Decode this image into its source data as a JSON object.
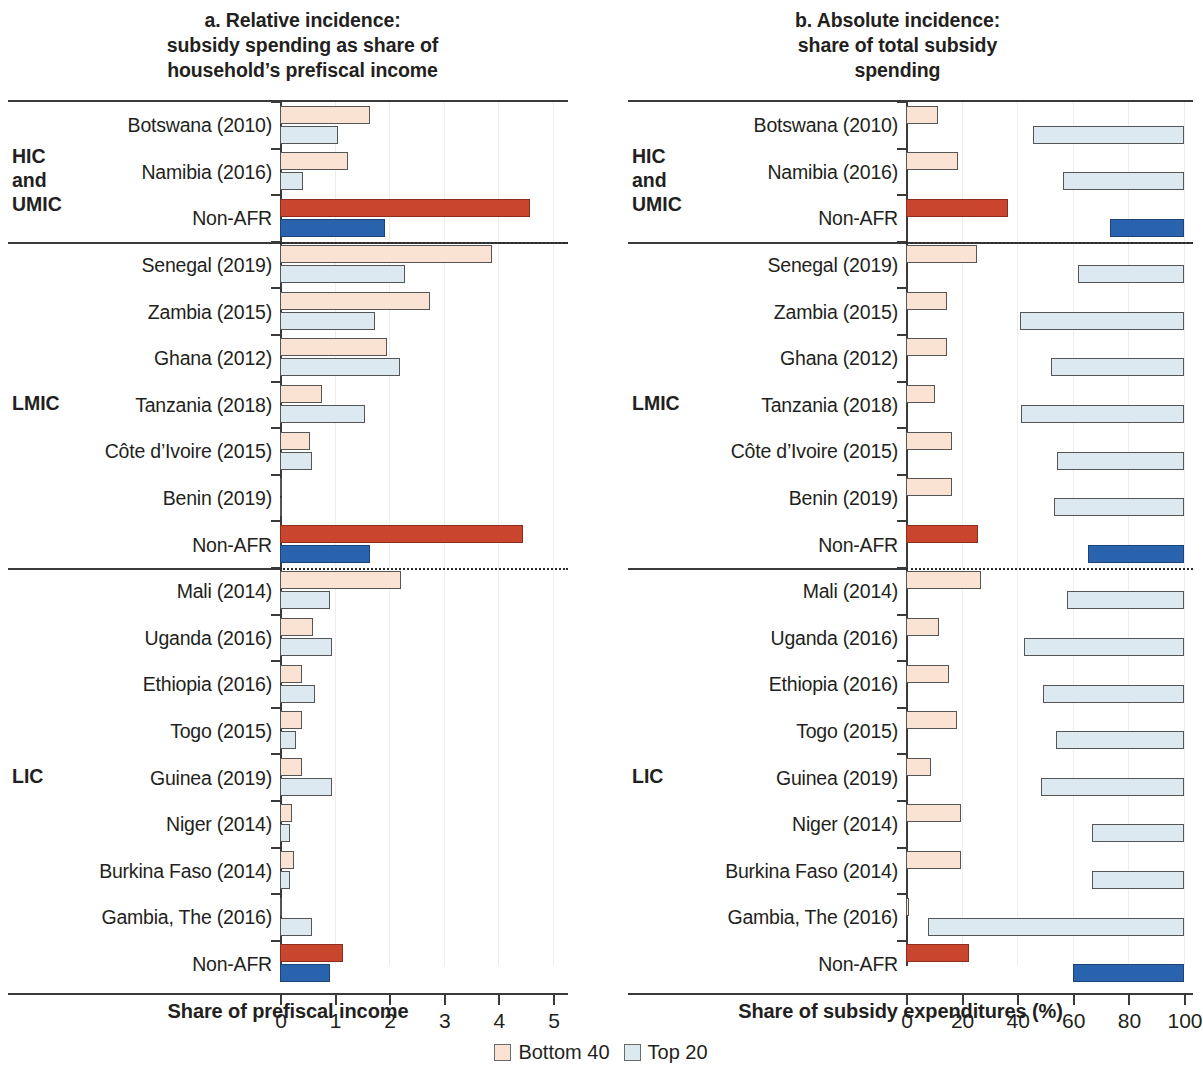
{
  "panels": {
    "a": {
      "title_lines": [
        "a. Relative incidence:",
        "subsidy spending as share of",
        "household’s prefiscal income"
      ],
      "axis_title": "Share of prefiscal income",
      "xticks": [
        "0",
        "1",
        "2",
        "3",
        "4",
        "5"
      ]
    },
    "b": {
      "title_lines": [
        "b. Absolute incidence:",
        "share of total subsidy",
        "spending"
      ],
      "axis_title": "Share of subsidy expenditures (%)",
      "xticks": [
        "0",
        "20",
        "40",
        "60",
        "80",
        "100"
      ]
    }
  },
  "groups": [
    {
      "label_lines": [
        "HIC",
        "and",
        "UMIC"
      ],
      "name": "HIC and UMIC"
    },
    {
      "label_lines": [
        "LMIC"
      ],
      "name": "LMIC"
    },
    {
      "label_lines": [
        "LIC"
      ],
      "name": "LIC"
    }
  ],
  "legend": [
    {
      "label": "Bottom 40",
      "color": "#fae3d2"
    },
    {
      "label": "Top 20",
      "color": "#dde9f1"
    }
  ],
  "colors": {
    "bottom40_fill": "#fae3d2",
    "top20_fill": "#dde9f1",
    "bottom40_highlight": "#c9452d",
    "top20_highlight": "#2963ae",
    "axis": "#3a3a3a"
  },
  "chart_data": [
    {
      "type": "bar",
      "panel": "a",
      "title": "a. Relative incidence: subsidy spending as share of household’s prefiscal income",
      "xlabel": "Share of prefiscal income",
      "ylabel": "",
      "xlim": [
        0,
        5
      ],
      "orientation": "horizontal",
      "grid": false,
      "legend": [
        "Bottom 40",
        "Top 20"
      ],
      "groups": [
        "HIC and UMIC",
        "LMIC",
        "LIC"
      ],
      "categories": [
        "Botswana (2010)",
        "Namibia (2016)",
        "Non-AFR",
        "Senegal (2019)",
        "Zambia (2015)",
        "Ghana (2012)",
        "Tanzania (2018)",
        "Côte d’Ivoire (2015)",
        "Benin (2019)",
        "Non-AFR",
        "Mali (2014)",
        "Uganda (2016)",
        "Ethiopia (2016)",
        "Togo (2015)",
        "Guinea (2019)",
        "Niger (2014)",
        "Burkina Faso (2014)",
        "Gambia, The (2016)",
        "Non-AFR"
      ],
      "series": [
        {
          "name": "Bottom 40",
          "values": [
            1.65,
            1.24,
            4.58,
            3.88,
            2.75,
            1.96,
            0.77,
            0.55,
            0.02,
            4.45,
            2.22,
            0.61,
            0.41,
            0.4,
            0.4,
            0.22,
            0.25,
            0.01,
            1.15
          ]
        },
        {
          "name": "Top 20",
          "values": [
            1.06,
            0.42,
            1.92,
            2.29,
            1.74,
            2.2,
            1.56,
            0.58,
            0.03,
            1.65,
            0.92,
            0.96,
            0.64,
            0.29,
            0.95,
            0.18,
            0.18,
            0.58,
            0.92
          ]
        }
      ],
      "highlighted_rows": [
        2,
        9,
        18
      ]
    },
    {
      "type": "bar",
      "panel": "b",
      "title": "b. Absolute incidence: share of total subsidy spending",
      "xlabel": "Share of subsidy expenditures (%)",
      "ylabel": "",
      "xlim": [
        0,
        100
      ],
      "orientation": "horizontal",
      "grid": false,
      "legend": [
        "Bottom 40",
        "Top 20"
      ],
      "note": "Top 20 bars are drawn right-aligned ending at 100.",
      "groups": [
        "HIC and UMIC",
        "LMIC",
        "LIC"
      ],
      "categories": [
        "Botswana (2010)",
        "Namibia (2016)",
        "Non-AFR",
        "Senegal (2019)",
        "Zambia (2015)",
        "Ghana (2012)",
        "Tanzania (2018)",
        "Côte d’Ivoire (2015)",
        "Benin (2019)",
        "Non-AFR",
        "Mali (2014)",
        "Uganda (2016)",
        "Ethiopia (2016)",
        "Togo (2015)",
        "Guinea (2019)",
        "Niger (2014)",
        "Burkina Faso (2014)",
        "Gambia, The (2016)",
        "Non-AFR"
      ],
      "series": [
        {
          "name": "Bottom 40",
          "values": [
            11.5,
            18.7,
            36.7,
            25.5,
            14.7,
            14.7,
            10.4,
            16.5,
            16.5,
            25.9,
            27.0,
            11.8,
            15.5,
            18.3,
            9.0,
            19.8,
            19.8,
            1.0,
            22.7
          ]
        },
        {
          "name": "Top 20",
          "values": [
            54.3,
            43.5,
            26.6,
            38.0,
            59.0,
            47.8,
            58.6,
            45.7,
            46.8,
            34.5,
            42.0,
            57.6,
            50.7,
            46.0,
            51.5,
            33.0,
            33.0,
            92.0,
            40.0
          ]
        }
      ],
      "highlighted_rows": [
        2,
        9,
        18
      ]
    }
  ]
}
